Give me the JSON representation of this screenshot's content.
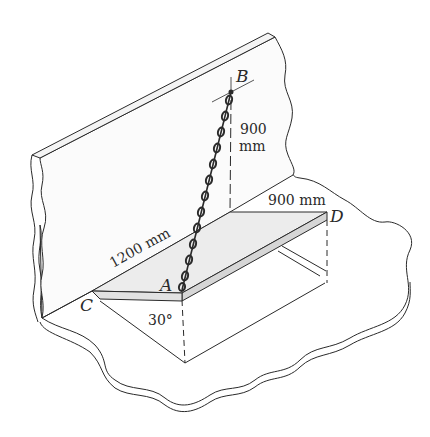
{
  "figure": {
    "points": {
      "A": "A",
      "B": "B",
      "C": "C",
      "D": "D"
    },
    "dimensions": {
      "vertical_height": "900",
      "vertical_height_unit": "mm",
      "plate_width": "900 mm",
      "plate_length": "1200 mm",
      "angle": "30°"
    },
    "colors": {
      "line": "#2a2a2a",
      "plate_fill": "#ececec",
      "plate_edge_fill": "#d6d6d6",
      "wall_fill": "#fbfbfb",
      "background": "#ffffff"
    }
  }
}
